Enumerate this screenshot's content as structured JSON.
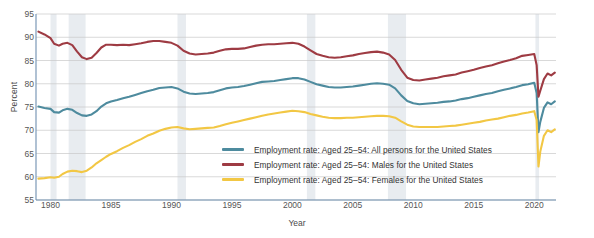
{
  "chart_data": {
    "type": "line",
    "title": "",
    "xlabel": "Year",
    "ylabel": "Percent",
    "xlim": [
      1978.8,
      2021.8
    ],
    "ylim": [
      55,
      95
    ],
    "yticks": [
      55,
      60,
      65,
      70,
      75,
      80,
      85,
      90,
      95
    ],
    "xticks": [
      1980,
      1985,
      1990,
      1995,
      2000,
      2005,
      2010,
      2015,
      2020
    ],
    "grid": "horizontal",
    "legend_position": "inside-center-bottom",
    "recession_bands": [
      [
        1980.0,
        1980.5
      ],
      [
        1981.5,
        1982.9
      ],
      [
        1990.5,
        1991.2
      ],
      [
        2001.2,
        2001.9
      ],
      [
        2007.9,
        2009.4
      ],
      [
        2020.1,
        2020.4
      ]
    ],
    "recession_band_color": "#e8ecf0",
    "series": [
      {
        "name": "Employment rate: Aged 25–54: All persons for the United States",
        "color": "#4e8b9e",
        "x": [
          1979.0,
          1979.5,
          1980.0,
          1980.3,
          1980.7,
          1981.0,
          1981.4,
          1981.8,
          1982.2,
          1982.6,
          1983.0,
          1983.4,
          1983.8,
          1984.2,
          1984.6,
          1985.0,
          1985.5,
          1986.0,
          1986.5,
          1987.0,
          1987.5,
          1988.0,
          1988.5,
          1989.0,
          1989.5,
          1990.0,
          1990.5,
          1991.0,
          1991.5,
          1992.0,
          1992.5,
          1993.0,
          1993.5,
          1994.0,
          1994.5,
          1995.0,
          1995.5,
          1996.0,
          1996.5,
          1997.0,
          1997.5,
          1998.0,
          1998.5,
          1999.0,
          1999.5,
          2000.0,
          2000.5,
          2001.0,
          2001.5,
          2002.0,
          2002.5,
          2003.0,
          2003.5,
          2004.0,
          2004.5,
          2005.0,
          2005.5,
          2006.0,
          2006.5,
          2007.0,
          2007.5,
          2008.0,
          2008.5,
          2009.0,
          2009.5,
          2010.0,
          2010.5,
          2011.0,
          2011.5,
          2012.0,
          2012.5,
          2013.0,
          2013.5,
          2014.0,
          2014.5,
          2015.0,
          2015.5,
          2016.0,
          2016.5,
          2017.0,
          2017.5,
          2018.0,
          2018.5,
          2019.0,
          2019.5,
          2020.0,
          2020.2,
          2020.35,
          2020.5,
          2020.8,
          2021.1,
          2021.4,
          2021.7
        ],
        "y": [
          75.1,
          74.8,
          74.6,
          73.9,
          73.8,
          74.3,
          74.6,
          74.4,
          73.7,
          73.2,
          73.1,
          73.4,
          74.1,
          75.1,
          75.8,
          76.2,
          76.5,
          76.9,
          77.2,
          77.6,
          78.0,
          78.4,
          78.7,
          79.1,
          79.2,
          79.3,
          79.0,
          78.3,
          77.9,
          77.8,
          77.9,
          78.0,
          78.2,
          78.6,
          79.0,
          79.2,
          79.3,
          79.5,
          79.8,
          80.1,
          80.4,
          80.5,
          80.6,
          80.8,
          81.0,
          81.2,
          81.2,
          80.9,
          80.4,
          79.9,
          79.6,
          79.3,
          79.2,
          79.2,
          79.3,
          79.4,
          79.6,
          79.8,
          80.0,
          80.1,
          80.0,
          79.8,
          79.0,
          77.5,
          76.3,
          75.8,
          75.6,
          75.7,
          75.8,
          75.9,
          76.1,
          76.2,
          76.4,
          76.7,
          76.9,
          77.2,
          77.5,
          77.8,
          78.0,
          78.4,
          78.7,
          79.0,
          79.3,
          79.7,
          79.9,
          80.2,
          78.0,
          69.6,
          71.8,
          74.8,
          76.0,
          75.6,
          76.2
        ]
      },
      {
        "name": "Employment rate: Aged 25–54: Males for the United States",
        "color": "#9e3b43",
        "x": [
          1979.0,
          1979.5,
          1980.0,
          1980.3,
          1980.7,
          1981.0,
          1981.4,
          1981.8,
          1982.2,
          1982.6,
          1983.0,
          1983.4,
          1983.8,
          1984.2,
          1984.6,
          1985.0,
          1985.5,
          1986.0,
          1986.5,
          1987.0,
          1987.5,
          1988.0,
          1988.5,
          1989.0,
          1989.5,
          1990.0,
          1990.5,
          1991.0,
          1991.5,
          1992.0,
          1992.5,
          1993.0,
          1993.5,
          1994.0,
          1994.5,
          1995.0,
          1995.5,
          1996.0,
          1996.5,
          1997.0,
          1997.5,
          1998.0,
          1998.5,
          1999.0,
          1999.5,
          2000.0,
          2000.5,
          2001.0,
          2001.5,
          2002.0,
          2002.5,
          2003.0,
          2003.5,
          2004.0,
          2004.5,
          2005.0,
          2005.5,
          2006.0,
          2006.5,
          2007.0,
          2007.5,
          2008.0,
          2008.5,
          2009.0,
          2009.5,
          2010.0,
          2010.5,
          2011.0,
          2011.5,
          2012.0,
          2012.5,
          2013.0,
          2013.5,
          2014.0,
          2014.5,
          2015.0,
          2015.5,
          2016.0,
          2016.5,
          2017.0,
          2017.5,
          2018.0,
          2018.5,
          2019.0,
          2019.5,
          2020.0,
          2020.2,
          2020.35,
          2020.5,
          2020.8,
          2021.1,
          2021.4,
          2021.7
        ],
        "y": [
          91.2,
          90.6,
          89.8,
          88.6,
          88.2,
          88.6,
          88.8,
          88.3,
          86.9,
          85.7,
          85.3,
          85.6,
          86.6,
          87.8,
          88.4,
          88.4,
          88.3,
          88.4,
          88.3,
          88.5,
          88.7,
          89.0,
          89.2,
          89.2,
          89.0,
          88.8,
          88.2,
          87.1,
          86.5,
          86.3,
          86.4,
          86.5,
          86.7,
          87.1,
          87.4,
          87.5,
          87.5,
          87.6,
          87.9,
          88.2,
          88.4,
          88.5,
          88.5,
          88.6,
          88.7,
          88.8,
          88.6,
          88.0,
          87.2,
          86.4,
          86.0,
          85.7,
          85.6,
          85.7,
          85.9,
          86.1,
          86.4,
          86.6,
          86.8,
          86.9,
          86.7,
          86.3,
          85.1,
          83.0,
          81.3,
          80.8,
          80.7,
          80.9,
          81.1,
          81.3,
          81.6,
          81.8,
          82.0,
          82.4,
          82.7,
          83.0,
          83.4,
          83.7,
          84.0,
          84.4,
          84.8,
          85.1,
          85.5,
          86.0,
          86.2,
          86.4,
          84.0,
          77.2,
          78.5,
          81.0,
          82.2,
          81.8,
          82.4
        ]
      },
      {
        "name": "Employment rate: Aged 25–54: Females for the United States",
        "color": "#f2c744",
        "x": [
          1979.0,
          1979.5,
          1980.0,
          1980.3,
          1980.7,
          1981.0,
          1981.4,
          1981.8,
          1982.2,
          1982.6,
          1983.0,
          1983.4,
          1983.8,
          1984.2,
          1984.6,
          1985.0,
          1985.5,
          1986.0,
          1986.5,
          1987.0,
          1987.5,
          1988.0,
          1988.5,
          1989.0,
          1989.5,
          1990.0,
          1990.5,
          1991.0,
          1991.5,
          1992.0,
          1992.5,
          1993.0,
          1993.5,
          1994.0,
          1994.5,
          1995.0,
          1995.5,
          1996.0,
          1996.5,
          1997.0,
          1997.5,
          1998.0,
          1998.5,
          1999.0,
          1999.5,
          2000.0,
          2000.5,
          2001.0,
          2001.5,
          2002.0,
          2002.5,
          2003.0,
          2003.5,
          2004.0,
          2004.5,
          2005.0,
          2005.5,
          2006.0,
          2006.5,
          2007.0,
          2007.5,
          2008.0,
          2008.5,
          2009.0,
          2009.5,
          2010.0,
          2010.5,
          2011.0,
          2011.5,
          2012.0,
          2012.5,
          2013.0,
          2013.5,
          2014.0,
          2014.5,
          2015.0,
          2015.5,
          2016.0,
          2016.5,
          2017.0,
          2017.5,
          2018.0,
          2018.5,
          2019.0,
          2019.5,
          2020.0,
          2020.2,
          2020.35,
          2020.5,
          2020.8,
          2021.1,
          2021.4,
          2021.7
        ],
        "y": [
          59.6,
          59.7,
          59.9,
          59.8,
          60.0,
          60.6,
          61.1,
          61.3,
          61.2,
          61.0,
          61.3,
          62.0,
          62.9,
          63.6,
          64.3,
          64.9,
          65.5,
          66.2,
          66.8,
          67.5,
          68.1,
          68.8,
          69.3,
          69.9,
          70.3,
          70.6,
          70.7,
          70.4,
          70.2,
          70.3,
          70.4,
          70.5,
          70.6,
          70.9,
          71.3,
          71.6,
          71.9,
          72.2,
          72.5,
          72.8,
          73.1,
          73.4,
          73.6,
          73.8,
          74.0,
          74.2,
          74.1,
          73.9,
          73.5,
          73.2,
          72.9,
          72.7,
          72.6,
          72.6,
          72.7,
          72.7,
          72.8,
          72.9,
          73.0,
          73.1,
          73.1,
          73.0,
          72.7,
          71.9,
          71.2,
          70.8,
          70.7,
          70.7,
          70.7,
          70.7,
          70.8,
          70.9,
          71.0,
          71.2,
          71.4,
          71.6,
          71.8,
          72.1,
          72.3,
          72.5,
          72.8,
          73.1,
          73.3,
          73.6,
          73.8,
          74.1,
          72.2,
          62.2,
          65.4,
          68.8,
          70.0,
          69.6,
          70.2
        ]
      }
    ]
  },
  "axes": {
    "ylabel": "Percent",
    "xlabel": "Year",
    "ytick_labels": [
      "55",
      "60",
      "65",
      "70",
      "75",
      "80",
      "85",
      "90",
      "95"
    ],
    "xtick_labels": [
      "1980",
      "1985",
      "1990",
      "1995",
      "2000",
      "2005",
      "2010",
      "2015",
      "2020"
    ]
  },
  "legend": {
    "items": [
      {
        "label": "Employment rate: Aged 25–54: All persons for the United States",
        "color": "#4e8b9e"
      },
      {
        "label": "Employment rate: Aged 25–54: Males for the United States",
        "color": "#9e3b43"
      },
      {
        "label": "Employment rate: Aged 25–54: Females for the United States",
        "color": "#f2c744"
      }
    ]
  },
  "style": {
    "grid_color": "#c8c8c8",
    "axis_color": "#6f8fb0",
    "background": "#ffffff"
  }
}
